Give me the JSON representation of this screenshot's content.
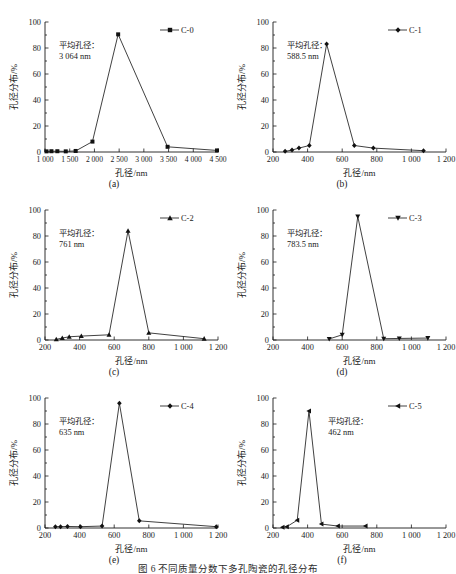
{
  "figure": {
    "bottom_caption": "图 6  不同质量分数下多孔陶瓷的孔径分布",
    "panels": [
      {
        "id": "a",
        "label": "(a)",
        "series_name": "C-0",
        "marker": "square",
        "annotation_line1": "平均孔径：",
        "annotation_line2": "3 064 nm",
        "chart_data": {
          "type": "line",
          "title": "",
          "xlabel": "孔径/nm",
          "ylabel": "孔径分布/%",
          "xlim": [
            1000,
            4500
          ],
          "ylim": [
            0,
            100
          ],
          "xticks": [
            1000,
            1500,
            2000,
            2500,
            3000,
            3500,
            4000,
            4500
          ],
          "xticklabels": [
            "1 000",
            "1 500",
            "2 000",
            "2 500",
            "3 000",
            "3 500",
            "4 000",
            "4 500"
          ],
          "yticks": [
            0,
            20,
            40,
            60,
            80,
            100
          ],
          "yticklabels": [
            "0",
            "20",
            "40",
            "60",
            "80",
            "100"
          ],
          "grid": false,
          "legend_position": "top-right",
          "series": [
            {
              "name": "C-0",
              "x": [
                1030,
                1130,
                1250,
                1420,
                1620,
                1960,
                2480,
                3480,
                4480
              ],
              "y": [
                0.5,
                0.6,
                0.6,
                0.5,
                0.8,
                8.0,
                90.5,
                4.0,
                1.2
              ]
            }
          ]
        }
      },
      {
        "id": "b",
        "label": "(b)",
        "series_name": "C-1",
        "marker": "diamond",
        "annotation_line1": "平均孔径：",
        "annotation_line2": "588.5 nm",
        "chart_data": {
          "type": "line",
          "title": "",
          "xlabel": "孔径/nm",
          "ylabel": "孔径分布/%",
          "xlim": [
            200,
            1200
          ],
          "ylim": [
            0,
            100
          ],
          "xticks": [
            200,
            400,
            600,
            800,
            1000,
            1200
          ],
          "xticklabels": [
            "200",
            "400",
            "600",
            "800",
            "1 000",
            "1 200"
          ],
          "yticks": [
            0,
            20,
            40,
            60,
            80,
            100
          ],
          "yticklabels": [
            "0",
            "20",
            "40",
            "60",
            "80",
            "100"
          ],
          "grid": false,
          "legend_position": "top-right",
          "series": [
            {
              "name": "C-1",
              "x": [
                270,
                310,
                350,
                410,
                510,
                670,
                780,
                1070
              ],
              "y": [
                0.5,
                1.5,
                3.0,
                5.0,
                83.0,
                5.0,
                3.0,
                1.0
              ]
            }
          ]
        }
      },
      {
        "id": "c",
        "label": "(c)",
        "series_name": "C-2",
        "marker": "triangle-up",
        "annotation_line1": "平均孔径：",
        "annotation_line2": "761 nm",
        "chart_data": {
          "type": "line",
          "title": "",
          "xlabel": "孔径/nm",
          "ylabel": "孔径分布/%",
          "xlim": [
            200,
            1200
          ],
          "ylim": [
            0,
            100
          ],
          "xticks": [
            200,
            400,
            600,
            800,
            1000,
            1200
          ],
          "xticklabels": [
            "200",
            "400",
            "600",
            "800",
            "1 000",
            "1 200"
          ],
          "yticks": [
            0,
            20,
            40,
            60,
            80,
            100
          ],
          "yticklabels": [
            "0",
            "20",
            "40",
            "60",
            "80",
            "100"
          ],
          "grid": false,
          "legend_position": "top-right",
          "series": [
            {
              "name": "C-2",
              "x": [
                265,
                300,
                340,
                410,
                570,
                680,
                800,
                1120
              ],
              "y": [
                0.5,
                1.5,
                2.5,
                3.0,
                4.0,
                84.0,
                5.5,
                1.0
              ]
            }
          ]
        }
      },
      {
        "id": "d",
        "label": "(d)",
        "series_name": "C-3",
        "marker": "triangle-down",
        "annotation_line1": "平均孔径：",
        "annotation_line2": "783.5 nm",
        "chart_data": {
          "type": "line",
          "title": "",
          "xlabel": "孔径/nm",
          "ylabel": "孔径分布/%",
          "xlim": [
            200,
            1200
          ],
          "ylim": [
            0,
            100
          ],
          "xticks": [
            200,
            400,
            600,
            800,
            1000,
            1200
          ],
          "xticklabels": [
            "200",
            "400",
            "600",
            "800",
            "1 000",
            "1 200"
          ],
          "yticks": [
            0,
            20,
            40,
            60,
            80,
            100
          ],
          "yticklabels": [
            "0",
            "20",
            "40",
            "60",
            "80",
            "100"
          ],
          "grid": false,
          "legend_position": "top-right",
          "series": [
            {
              "name": "C-3",
              "x": [
                525,
                600,
                690,
                840,
                930,
                1095
              ],
              "y": [
                0.8,
                4.0,
                95.0,
                1.0,
                1.2,
                1.5
              ]
            }
          ]
        }
      },
      {
        "id": "e",
        "label": "(e)",
        "series_name": "C-4",
        "marker": "diamond",
        "annotation_line1": "平均孔径：",
        "annotation_line2": "635 nm",
        "chart_data": {
          "type": "line",
          "title": "",
          "xlabel": "孔径/nm",
          "ylabel": "孔径分布/%",
          "xlim": [
            200,
            1200
          ],
          "ylim": [
            0,
            100
          ],
          "xticks": [
            200,
            400,
            600,
            800,
            1000,
            1200
          ],
          "xticklabels": [
            "200",
            "400",
            "600",
            "800",
            "1 000",
            "1 200"
          ],
          "yticks": [
            0,
            20,
            40,
            60,
            80,
            100
          ],
          "yticklabels": [
            "0",
            "20",
            "40",
            "60",
            "80",
            "100"
          ],
          "grid": false,
          "legend_position": "top-right",
          "series": [
            {
              "name": "C-4",
              "x": [
                260,
                290,
                330,
                405,
                530,
                630,
                745,
                1190
              ],
              "y": [
                1.0,
                1.0,
                1.2,
                1.0,
                1.5,
                96.0,
                5.5,
                1.0
              ]
            }
          ]
        }
      },
      {
        "id": "f",
        "label": "(f)",
        "series_name": "C-5",
        "marker": "triangle-left",
        "annotation_line1": "平均孔径：",
        "annotation_line2": "462 nm",
        "chart_data": {
          "type": "line",
          "title": "",
          "xlabel": "孔径/nm",
          "ylabel": "孔径分布/%",
          "xlim": [
            200,
            1200
          ],
          "ylim": [
            0,
            100
          ],
          "xticks": [
            200,
            400,
            600,
            800,
            1000,
            1200
          ],
          "xticklabels": [
            "200",
            "400",
            "600",
            "800",
            "1 000",
            "1 200"
          ],
          "yticks": [
            0,
            20,
            40,
            60,
            80,
            100
          ],
          "yticklabels": [
            "0",
            "20",
            "40",
            "60",
            "80",
            "100"
          ],
          "grid": false,
          "legend_position": "top-right",
          "series": [
            {
              "name": "C-5",
              "x": [
                255,
                280,
                340,
                408,
                480,
                575,
                735
              ],
              "y": [
                0.5,
                1.0,
                6.0,
                90.0,
                3.0,
                1.5,
                1.5
              ]
            }
          ]
        }
      }
    ]
  }
}
